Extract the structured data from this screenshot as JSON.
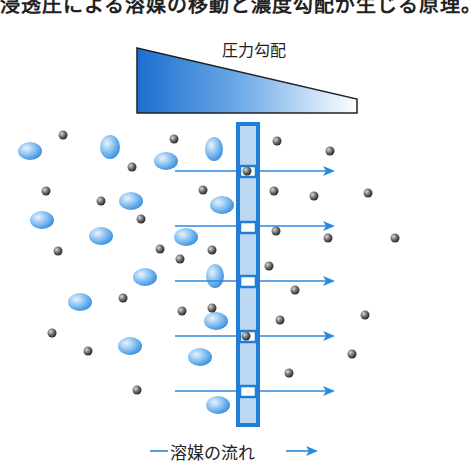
{
  "caption": {
    "text": "浸透圧による溶媒の移動と濃度勾配が生じる原理。"
  },
  "diagram": {
    "pressure_gradient_label": "圧力勾配",
    "solvent_flow_label": "溶媒の流れ",
    "colors": {
      "membrane": "#1f7fd6",
      "membrane_fill": "#bcd8f3",
      "arrow": "#2a8ae0",
      "wedge_dark": "#1a6fd0",
      "wedge_light": "#ffffff",
      "solute_blue": "#5aa6ea",
      "solvent_dark": "#444444"
    },
    "arrows_y": [
      171,
      226,
      281,
      336,
      391
    ],
    "pores_y": [
      172,
      228,
      282,
      337,
      392
    ]
  }
}
